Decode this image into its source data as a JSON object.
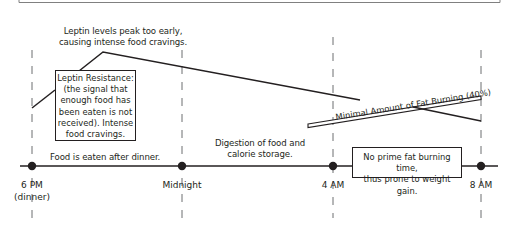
{
  "diagram": {
    "type": "timeline",
    "annotations": {
      "leptin_peak": [
        "Leptin levels peak too early,",
        "causing intense food cravings."
      ],
      "leptin_resistance": [
        "Leptin Resistance:",
        "(the signal that",
        "enough food has",
        "been eaten is not",
        "received).  Intense",
        "food cravings."
      ],
      "fat_burning": "Minimal Amount of Fat Burning (40%)",
      "food_eaten": "Food is eaten after dinner.",
      "digestion": [
        "Digestion of food and",
        "calorie storage."
      ],
      "no_prime": [
        "No prime fat burning time,",
        "thus prone to weight gain."
      ]
    },
    "timepoints": [
      {
        "label": "6 PM",
        "sublabel": "(dinner)"
      },
      {
        "label": "Midnight"
      },
      {
        "label": "4 AM"
      },
      {
        "label": "8 AM"
      }
    ],
    "colors": {
      "line": "#231f20",
      "dashed": "#6d6e71",
      "frame": "#808080"
    }
  }
}
